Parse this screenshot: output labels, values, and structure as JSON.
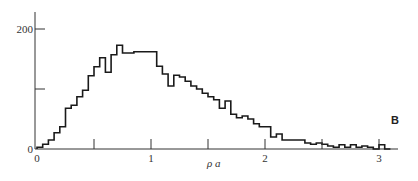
{
  "chart_data": {
    "type": "bar",
    "subtype": "histogram-step",
    "title": "",
    "panel_label": "B",
    "xlabel": "ρ a",
    "ylabel": "",
    "xlim": [
      0,
      3.15
    ],
    "ylim": [
      0,
      230
    ],
    "x_ticks": [
      0,
      0.5,
      1,
      1.5,
      2,
      2.5,
      3
    ],
    "x_tick_labels": [
      "0",
      "",
      "1",
      "",
      "2",
      "",
      "3"
    ],
    "y_ticks": [
      0,
      100,
      200
    ],
    "y_tick_labels": [
      "0",
      "",
      "200"
    ],
    "grid": false,
    "legend": null,
    "bin_width": 0.05,
    "bin_starts": [
      0.0,
      0.05,
      0.1,
      0.15,
      0.2,
      0.25,
      0.3,
      0.35,
      0.4,
      0.45,
      0.5,
      0.55,
      0.6,
      0.65,
      0.7,
      0.75,
      0.8,
      0.85,
      0.9,
      0.95,
      1.0,
      1.05,
      1.1,
      1.15,
      1.2,
      1.25,
      1.3,
      1.35,
      1.4,
      1.45,
      1.5,
      1.55,
      1.6,
      1.65,
      1.7,
      1.75,
      1.8,
      1.85,
      1.9,
      1.95,
      2.0,
      2.05,
      2.1,
      2.15,
      2.2,
      2.25,
      2.3,
      2.35,
      2.4,
      2.45,
      2.5,
      2.55,
      2.6,
      2.65,
      2.7,
      2.75,
      2.8,
      2.85,
      2.9,
      2.95,
      3.0,
      3.05
    ],
    "values": [
      3,
      8,
      15,
      27,
      37,
      68,
      73,
      87,
      98,
      122,
      137,
      152,
      128,
      157,
      173,
      160,
      160,
      162,
      162,
      162,
      162,
      138,
      125,
      105,
      123,
      120,
      113,
      105,
      100,
      93,
      87,
      82,
      68,
      80,
      58,
      52,
      55,
      50,
      42,
      37,
      37,
      20,
      25,
      15,
      15,
      15,
      15,
      10,
      8,
      10,
      8,
      5,
      3,
      7,
      3,
      7,
      3,
      5,
      3,
      0,
      7,
      0
    ],
    "series_color": "#1a1a1a"
  }
}
